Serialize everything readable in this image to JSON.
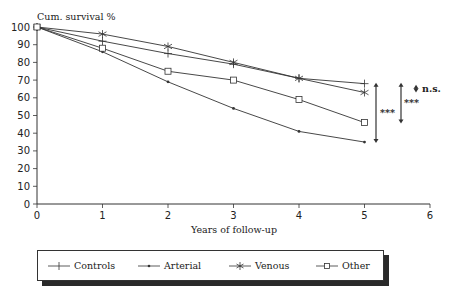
{
  "chart_data": {
    "type": "line",
    "title": "",
    "ylabel": "Cum. survival %",
    "xlabel": "Years of follow-up",
    "x": [
      0,
      1,
      2,
      3,
      4,
      5
    ],
    "xlim": [
      0,
      6
    ],
    "ylim": [
      0,
      100
    ],
    "xticks": [
      "0",
      "1",
      "2",
      "3",
      "4",
      "5",
      "6"
    ],
    "yticks": [
      "0",
      "10",
      "20",
      "30",
      "40",
      "50",
      "60",
      "70",
      "80",
      "90",
      "100"
    ],
    "grid": false,
    "legend_position": "bottom",
    "series": [
      {
        "name": "Controls",
        "marker": "plus",
        "values": [
          100,
          92,
          85,
          79,
          71,
          68
        ]
      },
      {
        "name": "Arterial",
        "marker": "dot",
        "values": [
          100,
          86,
          69,
          54,
          41,
          35
        ]
      },
      {
        "name": "Venous",
        "marker": "asterisk",
        "values": [
          100,
          96,
          89,
          80,
          71,
          63
        ]
      },
      {
        "name": "Other",
        "marker": "square",
        "values": [
          100,
          88,
          75,
          70,
          59,
          46
        ]
      }
    ],
    "annotations": [
      {
        "text": "***",
        "between": [
          "Controls",
          "Arterial"
        ],
        "at_x": 5
      },
      {
        "text": "***",
        "between": [
          "Controls",
          "Other"
        ],
        "at_x": 5
      },
      {
        "text": "n.s.",
        "between": [
          "Controls",
          "Venous"
        ],
        "at_x": 5
      }
    ]
  },
  "legend": {
    "items": [
      {
        "label": "Controls",
        "marker": "plus"
      },
      {
        "label": "Arterial",
        "marker": "dot"
      },
      {
        "label": "Venous",
        "marker": "asterisk"
      },
      {
        "label": "Other",
        "marker": "square"
      }
    ]
  },
  "colors": {
    "line": "#333333",
    "text": "#222222",
    "shadow": "#2a2a2a"
  }
}
